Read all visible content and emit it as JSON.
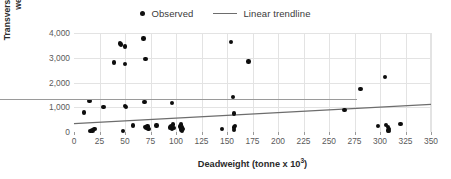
{
  "legend": {
    "position": "top-center",
    "entries": [
      {
        "label": "Observed",
        "marker": "dot",
        "color": "#0d0d0d"
      },
      {
        "label": "Linear trendline",
        "marker": "line",
        "color": "#6d6d6d"
      }
    ]
  },
  "axis_titles": {
    "x_prefix": "Deadweight (tonne x 10",
    "x_superscript": "3",
    "x_suffix": ")",
    "y": "Transverse group renewal weight (kg)"
  },
  "chart_data": {
    "type": "scatter",
    "title": "",
    "xlabel": "Deadweight (tonne x 10^3)",
    "ylabel": "Transverse group renewal weight (kg)",
    "xlim": [
      0,
      350
    ],
    "ylim": [
      0,
      4000
    ],
    "xticks": [
      0,
      25,
      50,
      75,
      100,
      125,
      150,
      175,
      200,
      225,
      250,
      275,
      300,
      325,
      350
    ],
    "yticks": [
      0,
      1000,
      2000,
      3000,
      4000
    ],
    "xtick_labels": [
      "0",
      "25",
      "50",
      "75",
      "100",
      "125",
      "150",
      "175",
      "200",
      "225",
      "250",
      "275",
      "300",
      "325",
      "350"
    ],
    "ytick_labels": [
      "0",
      "1,000",
      "2,000",
      "3,000",
      "4,000"
    ],
    "grid": true,
    "legend_position": "top-center",
    "series": [
      {
        "name": "Observed",
        "type": "scatter",
        "color": "#0d0d0d",
        "points": [
          [
            10,
            790
          ],
          [
            15,
            1250
          ],
          [
            16,
            40
          ],
          [
            18,
            60
          ],
          [
            20,
            110
          ],
          [
            29,
            1000
          ],
          [
            39,
            2810
          ],
          [
            45,
            3580
          ],
          [
            46,
            3540
          ],
          [
            48,
            50
          ],
          [
            50,
            3460
          ],
          [
            50,
            2760
          ],
          [
            50,
            1060
          ],
          [
            51,
            1010
          ],
          [
            58,
            260
          ],
          [
            68,
            3780
          ],
          [
            69,
            1220
          ],
          [
            70,
            2950
          ],
          [
            70,
            200
          ],
          [
            71,
            150
          ],
          [
            72,
            230
          ],
          [
            73,
            120
          ],
          [
            81,
            270
          ],
          [
            94,
            180
          ],
          [
            95,
            240
          ],
          [
            96,
            1180
          ],
          [
            96,
            130
          ],
          [
            97,
            300
          ],
          [
            98,
            160
          ],
          [
            104,
            230
          ],
          [
            105,
            100
          ],
          [
            105,
            310
          ],
          [
            106,
            60
          ],
          [
            106,
            180
          ],
          [
            107,
            120
          ],
          [
            145,
            130
          ],
          [
            154,
            3630
          ],
          [
            156,
            1420
          ],
          [
            157,
            740
          ],
          [
            157,
            180
          ],
          [
            157,
            90
          ],
          [
            158,
            240
          ],
          [
            171,
            2850
          ],
          [
            265,
            900
          ],
          [
            281,
            1750
          ],
          [
            298,
            240
          ],
          [
            305,
            2220
          ],
          [
            306,
            290
          ],
          [
            308,
            200
          ],
          [
            308,
            60
          ],
          [
            309,
            30
          ],
          [
            309,
            120
          ],
          [
            320,
            330
          ]
        ]
      },
      {
        "name": "Linear trendline",
        "type": "line",
        "color": "#6d6d6d",
        "points": [
          [
            0,
            340
          ],
          [
            350,
            1120
          ]
        ]
      }
    ]
  }
}
